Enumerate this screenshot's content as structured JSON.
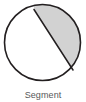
{
  "figure": {
    "caption": "Segment",
    "shape_name": "circle-with-segment",
    "colors": {
      "background": "#ffffff",
      "circle_outline": "#231f20",
      "circle_fill": "#ffffff",
      "segment_fill": "#d2d2d2",
      "chord_line": "#231f20",
      "caption_text": "#58585a"
    },
    "geometry": {
      "circle_center_x": 42.5,
      "circle_center_y": 42.5,
      "circle_radius": 38,
      "chord_start_x": 34,
      "chord_start_y": 9.5,
      "chord_end_x": 73,
      "chord_end_y": 70,
      "stroke_width": 1.6
    },
    "labels": {
      "segment_region": "Segment",
      "major_region": "major region"
    }
  }
}
